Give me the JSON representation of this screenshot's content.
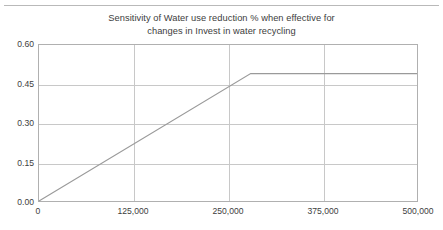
{
  "chart_data": {
    "type": "line",
    "title": "Sensitivity of Water use reduction % when effective for changes in Invest in water recycling",
    "title_lines": [
      "Sensitivity of  Water use reduction % when effective for",
      "changes in Invest in water recycling"
    ],
    "xlabel": "",
    "ylabel": "",
    "xlim": [
      0,
      500000
    ],
    "ylim": [
      0.0,
      0.6
    ],
    "xticks": [
      0,
      125000,
      250000,
      375000,
      500000
    ],
    "xticklabels": [
      "0",
      "125,000",
      "250,000",
      "375,000",
      "500,000"
    ],
    "yticks": [
      0.0,
      0.15,
      0.3,
      0.45,
      0.6
    ],
    "yticklabels": [
      "0.00",
      "0.15",
      "0.30",
      "0.45",
      "0.60"
    ],
    "grid": true,
    "legend": false,
    "series": [
      {
        "name": "Water use reduction %",
        "color": "#9a9a9a",
        "x": [
          0,
          280000,
          500000
        ],
        "y": [
          0.0,
          0.49,
          0.49
        ],
        "points": [
          {
            "x": 0,
            "y": 0.0
          },
          {
            "x": 280000,
            "y": 0.49
          },
          {
            "x": 500000,
            "y": 0.49
          }
        ]
      }
    ],
    "annotations": []
  },
  "style": {
    "line_color": "#9a9a9a",
    "grid_color": "#c8c8c8",
    "frame_color": "#b0b0b0",
    "text_color": "#3d3d3d",
    "rule_color": "#b9b9b9",
    "background": "#ffffff"
  }
}
